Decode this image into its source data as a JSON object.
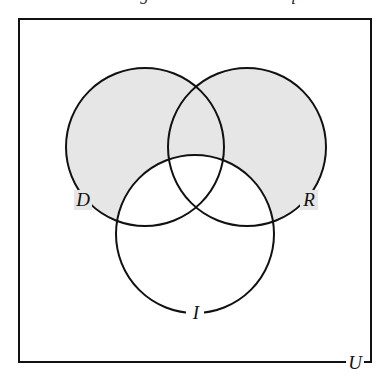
{
  "diagram": {
    "type": "venn",
    "universe": {
      "label": "U",
      "x": 19,
      "y": 19,
      "width": 352,
      "height": 343
    },
    "sets": [
      {
        "id": "D",
        "label": "D",
        "cx": 145,
        "cy": 147,
        "r": 79,
        "shaded": true,
        "label_x": 84,
        "label_y": 206
      },
      {
        "id": "R",
        "label": "R",
        "cx": 247,
        "cy": 147,
        "r": 79,
        "shaded": true,
        "label_x": 309,
        "label_y": 206
      },
      {
        "id": "I",
        "label": "I",
        "cx": 195,
        "cy": 234,
        "r": 79,
        "shaded": false,
        "label_x": 196,
        "label_y": 290
      }
    ],
    "shaded_region": "(D ∪ R) − I",
    "colors": {
      "shade": "#e6e6e6",
      "stroke": "#111111",
      "background": "#ffffff"
    }
  }
}
